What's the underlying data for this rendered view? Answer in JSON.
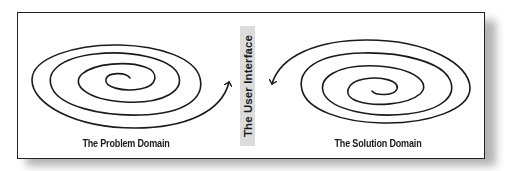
{
  "diagram": {
    "type": "flow-diagram",
    "left_panel": {
      "label": "The Problem Domain",
      "shape": "spiral",
      "arrow_direction": "outward-right-up"
    },
    "center_divider": {
      "label": "The User Interface",
      "orientation": "vertical"
    },
    "right_panel": {
      "label": "The Solution Domain",
      "shape": "spiral",
      "arrow_direction": "outward-left-down"
    },
    "colors": {
      "stroke": "#1a1a1a",
      "divider_background": "#dcdcdc",
      "frame_border": "#222222",
      "background": "#ffffff"
    }
  }
}
